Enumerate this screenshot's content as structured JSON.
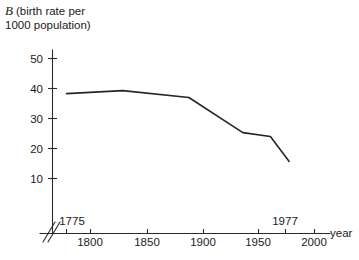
{
  "chart_data": {
    "type": "line",
    "title": "B (birth rate per 1000 population)",
    "title_symbol": "B",
    "title_rest_line1": "(birth rate per",
    "title_rest_line2": "1000 population)",
    "xlabel": "year",
    "ylabel": "B (birth rate per 1000 population)",
    "xlim": [
      1768,
      2014
    ],
    "ylim": [
      0,
      54
    ],
    "grid": false,
    "legend": null,
    "axis_break": {
      "axis": "x",
      "label": "double-slash break near origin",
      "present": true
    },
    "y_ticks": [
      10,
      20,
      30,
      40,
      50
    ],
    "y_tick_labels": [
      "10",
      "20",
      "30",
      "40",
      "50"
    ],
    "x_ticks": [
      1775,
      1800,
      1850,
      1900,
      1950,
      1977,
      2000
    ],
    "x_tick_labels_below": [
      "1800",
      "1850",
      "1900",
      "1950",
      "2000"
    ],
    "x_tick_labels_above": [
      "1775",
      "1977"
    ],
    "series": [
      {
        "name": "birth rate",
        "color": "#262626",
        "x": [
          1775,
          1826,
          1886,
          1935,
          1960,
          1977
        ],
        "values": [
          38.3,
          39.3,
          37.0,
          25.3,
          24.0,
          15.7
        ]
      }
    ],
    "points": [
      {
        "year": 1775,
        "rate": 38.3
      },
      {
        "year": 1826,
        "rate": 39.3
      },
      {
        "year": 1886,
        "rate": 37.0
      },
      {
        "year": 1935,
        "rate": 25.3
      },
      {
        "year": 1960,
        "rate": 24.0
      },
      {
        "year": 1977,
        "rate": 15.7
      }
    ]
  },
  "colors": {
    "background": "#ffffff",
    "axis": "#2b2b2b",
    "line": "#262626",
    "text": "#1a1a1a"
  }
}
